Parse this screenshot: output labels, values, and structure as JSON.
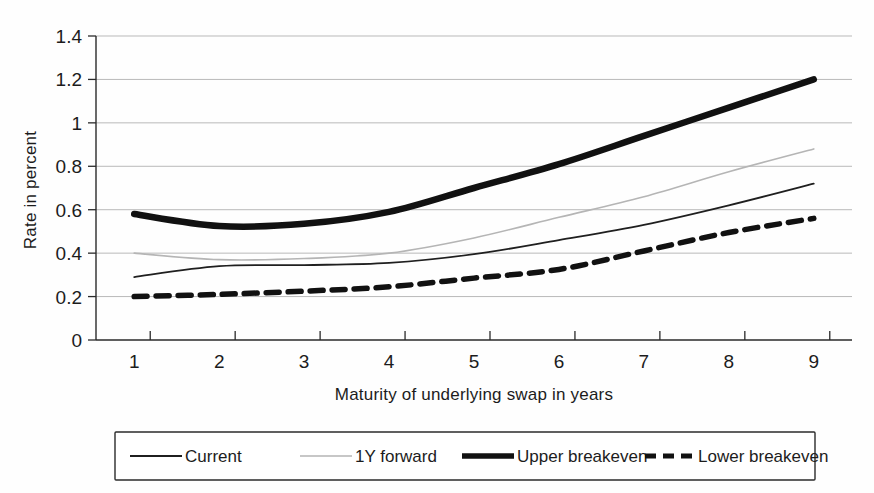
{
  "chart_data": {
    "type": "line",
    "title": "",
    "subtitle": "",
    "xlabel": "Maturity of underlying swap in years",
    "ylabel": "Rate in percent",
    "x": [
      1,
      2,
      3,
      4,
      5,
      6,
      7,
      8,
      9
    ],
    "xticklabels": [
      "1",
      "2",
      "3",
      "4",
      "5",
      "6",
      "7",
      "8",
      "9"
    ],
    "yticklabels": [
      "0",
      "0.2",
      "0.4",
      "0.6",
      "0.8",
      "1",
      "1.2",
      "1.4"
    ],
    "yticks": [
      0,
      0.2,
      0.4,
      0.6,
      0.8,
      1,
      1.2,
      1.4
    ],
    "xlim": [
      0.55,
      9.45
    ],
    "ylim": [
      0,
      1.4
    ],
    "grid": "horizontal",
    "legend_position": "bottom",
    "series": [
      {
        "name": "Current",
        "style": "solid-thin",
        "color": "#1f1f1f",
        "width": 1.8,
        "values": [
          0.29,
          0.34,
          0.345,
          0.355,
          0.395,
          0.46,
          0.53,
          0.62,
          0.72
        ]
      },
      {
        "name": "1Y forward",
        "style": "solid-light",
        "color": "#b5b5b5",
        "width": 1.6,
        "values": [
          0.4,
          0.37,
          0.375,
          0.4,
          0.47,
          0.565,
          0.66,
          0.775,
          0.88
        ]
      },
      {
        "name": "Upper breakeven",
        "style": "solid-thick",
        "color": "#111111",
        "width": 6.5,
        "values": [
          0.58,
          0.525,
          0.535,
          0.59,
          0.7,
          0.81,
          0.94,
          1.07,
          1.2
        ]
      },
      {
        "name": "Lower breakeven",
        "style": "dashed-thick",
        "color": "#111111",
        "width": 5.5,
        "values": [
          0.2,
          0.21,
          0.225,
          0.245,
          0.285,
          0.325,
          0.41,
          0.495,
          0.56
        ]
      }
    ]
  },
  "legend": {
    "entries": [
      {
        "label": "Current"
      },
      {
        "label": "1Y forward"
      },
      {
        "label": "Upper breakeven"
      },
      {
        "label": "Lower breakeven"
      }
    ]
  },
  "axes": {
    "y_title": "Rate in percent",
    "x_title": "Maturity of underlying swap in years"
  }
}
